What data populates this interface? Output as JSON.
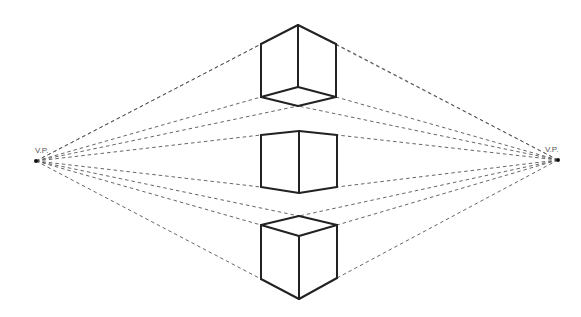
{
  "colors": {
    "line": "#222222",
    "guide": "#555555",
    "background": "#ffffff"
  },
  "vanishing_points": [
    {
      "id": "left",
      "label": "V.P.",
      "x": 36,
      "y": 161,
      "label_x": 35,
      "label_y": 146
    },
    {
      "id": "right",
      "label": "V.P.",
      "x": 558,
      "y": 160,
      "label_x": 545,
      "label_y": 145
    }
  ],
  "cubes": [
    {
      "name": "top-cube-above-horizon",
      "vertices": {
        "top": [
          298,
          25
        ],
        "lt": [
          261,
          44
        ],
        "rt": [
          336,
          44
        ],
        "lb": [
          261,
          97
        ],
        "rb": [
          336,
          97
        ],
        "inner": [
          298,
          87
        ],
        "front": [
          298,
          106
        ]
      },
      "edges": [
        [
          "top",
          "lt"
        ],
        [
          "top",
          "rt"
        ],
        [
          "top",
          "inner"
        ],
        [
          "lt",
          "lb"
        ],
        [
          "rt",
          "rb"
        ],
        [
          "lb",
          "inner"
        ],
        [
          "rb",
          "inner"
        ],
        [
          "lb",
          "front"
        ],
        [
          "rb",
          "front"
        ]
      ],
      "guides_left": [
        "top",
        "lt",
        "lb",
        "front"
      ],
      "guides_right": [
        "top",
        "rt",
        "rb",
        "front"
      ]
    },
    {
      "name": "middle-cube-at-horizon",
      "vertices": {
        "lt": [
          261,
          135
        ],
        "ct": [
          299,
          131
        ],
        "rt": [
          337,
          135
        ],
        "lb": [
          261,
          187
        ],
        "cb": [
          299,
          193
        ],
        "rb": [
          337,
          187
        ]
      },
      "edges": [
        [
          "lt",
          "ct"
        ],
        [
          "ct",
          "rt"
        ],
        [
          "lt",
          "lb"
        ],
        [
          "ct",
          "cb"
        ],
        [
          "rt",
          "rb"
        ],
        [
          "lb",
          "cb"
        ],
        [
          "cb",
          "rb"
        ]
      ],
      "guides_left": [
        "lt",
        "lb"
      ],
      "guides_right": [
        "rt",
        "rb"
      ]
    },
    {
      "name": "bottom-cube-below-horizon",
      "vertices": {
        "back": [
          299,
          216
        ],
        "lt": [
          261,
          225
        ],
        "rt": [
          337,
          225
        ],
        "ft": [
          299,
          236
        ],
        "lb": [
          261,
          279
        ],
        "rb": [
          337,
          278
        ],
        "fb": [
          299,
          299
        ]
      },
      "edges": [
        [
          "back",
          "lt"
        ],
        [
          "back",
          "rt"
        ],
        [
          "lt",
          "ft"
        ],
        [
          "rt",
          "ft"
        ],
        [
          "lt",
          "lb"
        ],
        [
          "rt",
          "rb"
        ],
        [
          "ft",
          "fb"
        ],
        [
          "lb",
          "fb"
        ],
        [
          "rb",
          "fb"
        ]
      ],
      "guides_left": [
        "back",
        "lt",
        "lb"
      ],
      "guides_right": [
        "back",
        "rt",
        "rb"
      ]
    }
  ]
}
